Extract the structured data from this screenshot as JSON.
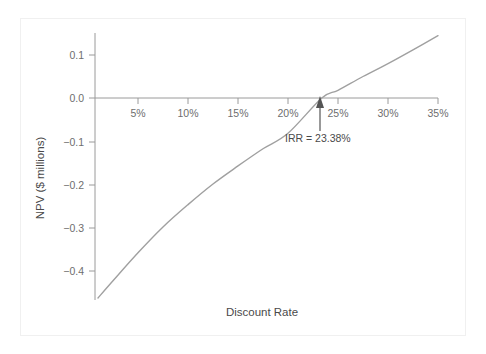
{
  "figure": {
    "background_color": "#ffffff",
    "frame_color": "#f0f0f0",
    "curve_color": "#a0a0a0",
    "axis_color": "#9a9a9a",
    "text_color": "#4a4a4a"
  },
  "chart_data": {
    "type": "line",
    "title": "",
    "xlabel": "Discount Rate",
    "ylabel": "NPV ($ millions)",
    "xlim": [
      0,
      35
    ],
    "ylim": [
      -0.5,
      0.16
    ],
    "grid": false,
    "legend": "none",
    "x_tick_labels": [
      "5%",
      "10%",
      "15%",
      "20%",
      "25%",
      "30%",
      "35%"
    ],
    "x_tick_values": [
      5,
      10,
      15,
      20,
      25,
      30,
      35
    ],
    "y_tick_labels": [
      "0.1",
      "0.0",
      "−0.1",
      "−0.2",
      "−0.3",
      "−0.4"
    ],
    "y_tick_values": [
      0.1,
      0.0,
      -0.1,
      -0.2,
      -0.3,
      -0.4
    ],
    "series": [
      {
        "name": "NPV profile",
        "x": [
          1.0,
          2.5,
          5.0,
          7.5,
          10.0,
          12.5,
          15.0,
          17.5,
          20.0,
          23.38,
          25.0,
          27.5,
          30.0,
          32.5,
          35.0
        ],
        "values": [
          -0.465,
          -0.425,
          -0.36,
          -0.3,
          -0.248,
          -0.2,
          -0.158,
          -0.118,
          -0.082,
          -0.0,
          0.018,
          0.05,
          0.08,
          0.112,
          0.145
        ]
      }
    ],
    "annotations": [
      {
        "name": "irr-annotation",
        "text": "IRR = 23.38%",
        "x": 23.38,
        "y": 0.0,
        "arrow": "up"
      }
    ]
  },
  "axis": {
    "x_label": "Discount Rate",
    "y_label": "NPV ($ millions)"
  },
  "annotation": {
    "irr_text": "IRR = 23.38%"
  },
  "ticks": {
    "x": [
      {
        "label": "5%"
      },
      {
        "label": "10%"
      },
      {
        "label": "15%"
      },
      {
        "label": "20%"
      },
      {
        "label": "25%"
      },
      {
        "label": "30%"
      },
      {
        "label": "35%"
      }
    ],
    "y": [
      {
        "label": "0.1"
      },
      {
        "label": "0.0"
      },
      {
        "label": "−0.1"
      },
      {
        "label": "−0.2"
      },
      {
        "label": "−0.3"
      },
      {
        "label": "−0.4"
      }
    ]
  }
}
